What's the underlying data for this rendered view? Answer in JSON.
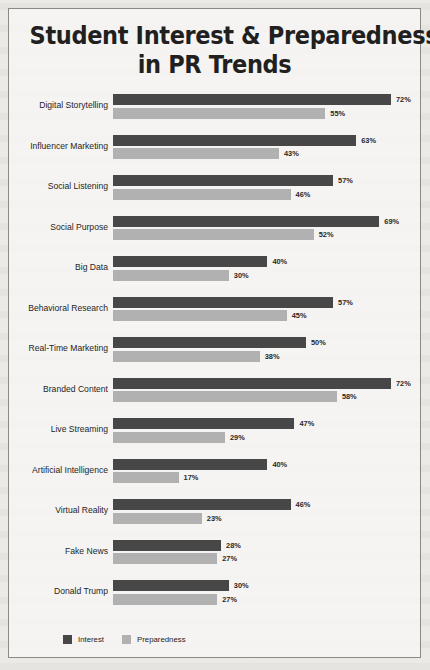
{
  "chart_data": {
    "type": "bar",
    "orientation": "horizontal",
    "title": "Student Interest & Preparedness in PR Trends",
    "title_lines": [
      "Student Interest & Preparedness",
      "in PR Trends"
    ],
    "xlabel": "",
    "ylabel": "",
    "xlim": [
      0,
      80
    ],
    "grid": false,
    "value_suffix": "%",
    "legend_position": "bottom-left",
    "categories": [
      "Digital Storytelling",
      "Influencer Marketing",
      "Social Listening",
      "Social Purpose",
      "Big Data",
      "Behavioral Research",
      "Real-Time Marketing",
      "Branded Content",
      "Live Streaming",
      "Artificial Intelligence",
      "Virtual Reality",
      "Fake News",
      "Donald Trump"
    ],
    "series": [
      {
        "name": "Interest",
        "color": "#474747",
        "values": [
          72,
          63,
          57,
          69,
          40,
          57,
          50,
          72,
          47,
          40,
          46,
          28,
          30
        ],
        "labels": [
          "72%",
          "63%",
          "57%",
          "69%",
          "40%",
          "57%",
          "50%",
          "72%",
          "47%",
          "40%",
          "46%",
          "28%",
          "30%"
        ]
      },
      {
        "name": "Preparedness",
        "color": "#b2b1b1",
        "values": [
          55,
          43,
          46,
          52,
          30,
          45,
          38,
          58,
          29,
          17,
          23,
          27,
          27
        ],
        "labels": [
          "55%",
          "43%",
          "46%",
          "52%",
          "30%",
          "45%",
          "38%",
          "58%",
          "29%",
          "17%",
          "23%",
          "27%",
          "27%"
        ]
      }
    ]
  },
  "legend": {
    "items": [
      {
        "label": "Interest",
        "color": "#474747"
      },
      {
        "label": "Preparedness",
        "color": "#b2b1b1"
      }
    ]
  }
}
